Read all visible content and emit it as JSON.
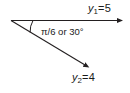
{
  "figure": {
    "type": "geometry-diagram",
    "background_color": "#ffffff",
    "stroke_color": "#231f20",
    "text_color": "#1a1a1a"
  },
  "vertex": {
    "name": "origin-vertex",
    "x": 11,
    "y": 20
  },
  "rays": [
    {
      "name": "ray-y1",
      "label_variable": "y",
      "label_subscript": "1",
      "label_equals": "=",
      "label_value": "5",
      "label_text": "y1 = 5",
      "from_x": 11,
      "from_y": 20,
      "to_x": 123,
      "to_y": 20,
      "direction_degrees": 0,
      "arrowhead": true
    },
    {
      "name": "ray-y2",
      "label_variable": "y",
      "label_subscript": "2",
      "label_equals": "=",
      "label_value": "4",
      "label_text": "y2 = 4",
      "from_x": 11,
      "from_y": 20,
      "to_x": 89,
      "to_y": 67,
      "direction_degrees": -30,
      "arrowhead": true
    }
  ],
  "angle": {
    "name": "angle-arc",
    "label_text": "π/6 or 30°",
    "radians": "π/6",
    "degrees": "30°",
    "conjunction": "or",
    "measure_degrees": 30,
    "arc_radius": 22
  }
}
